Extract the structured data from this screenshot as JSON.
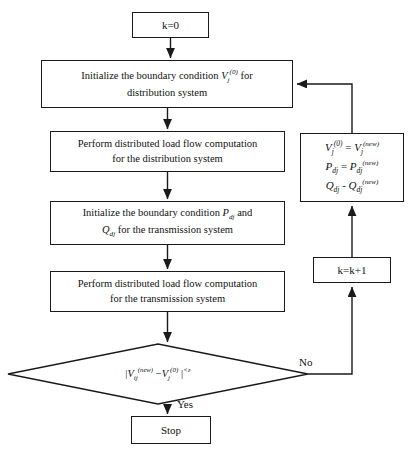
{
  "diagram": {
    "colors": {
      "stroke": "#1a1a1a",
      "fill": "#ffffff",
      "text": "#111111"
    },
    "nodes": {
      "start": {
        "shape": "process",
        "label": "k=0"
      },
      "init_distribution": {
        "shape": "process",
        "line1_pre": "Initialize the boundary condition ",
        "var": "V",
        "var_sub": "j",
        "var_sup": "(0)",
        "line1_post": " for",
        "line2": "distribution system"
      },
      "loadflow_distribution": {
        "shape": "process",
        "line1": "Perform distributed load flow computation",
        "line2": "for the distribution system"
      },
      "init_transmission": {
        "shape": "process",
        "line1_pre": "Initialize the boundary condition ",
        "var1": "P",
        "var1_sub": "dj",
        "line1_post": " and",
        "var2": "Q",
        "var2_sub": "dj",
        "line2_post": " for the transmission system"
      },
      "loadflow_transmission": {
        "shape": "process",
        "line1": "Perform distributed load flow computation",
        "line2": "for the transmission system"
      },
      "update": {
        "shape": "process",
        "eq1": {
          "lhs_var": "V",
          "lhs_sub": "j",
          "lhs_sup": "(0)",
          "op": "=",
          "rhs_var": "V",
          "rhs_sub": "j",
          "rhs_sup": "(new)"
        },
        "eq2": {
          "lhs_var": "P",
          "lhs_sub": "dj",
          "lhs_sup": "",
          "op": "=",
          "rhs_var": "P",
          "rhs_sub": "dj",
          "rhs_sup": "(new)"
        },
        "eq3": {
          "lhs_var": "Q",
          "lhs_sub": "dj",
          "lhs_sup": "",
          "op": "-",
          "rhs_var": "Q",
          "rhs_sub": "dj",
          "rhs_sup": "(new)"
        }
      },
      "increment": {
        "shape": "process",
        "label": "k=k+1"
      },
      "decision": {
        "shape": "decision",
        "bar_open": "|",
        "var1": "V",
        "var1_sub": "ij",
        "var1_sup": "(new)",
        "minus": "−",
        "var2": "V",
        "var2_sub": "j",
        "var2_sup": "(0)",
        "bar_close": "|",
        "comparator": "<",
        "epsilon": "ε"
      },
      "stop": {
        "shape": "terminator",
        "label": "Stop"
      }
    },
    "edges": {
      "yes_label": "Yes",
      "no_label": "No"
    }
  }
}
